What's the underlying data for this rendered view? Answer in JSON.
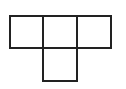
{
  "figure": {
    "shape": "T-tetromino",
    "stroke_color": "#222222",
    "background": "#ffffff",
    "cells": [
      {
        "row": 0,
        "col": 0,
        "x": 9,
        "y": 15,
        "w": 35,
        "h": 34
      },
      {
        "row": 0,
        "col": 1,
        "x": 42,
        "y": 15,
        "w": 36,
        "h": 34
      },
      {
        "row": 0,
        "col": 2,
        "x": 76,
        "y": 15,
        "w": 36,
        "h": 34
      },
      {
        "row": 1,
        "col": 1,
        "x": 42,
        "y": 47,
        "w": 36,
        "h": 35
      }
    ]
  }
}
